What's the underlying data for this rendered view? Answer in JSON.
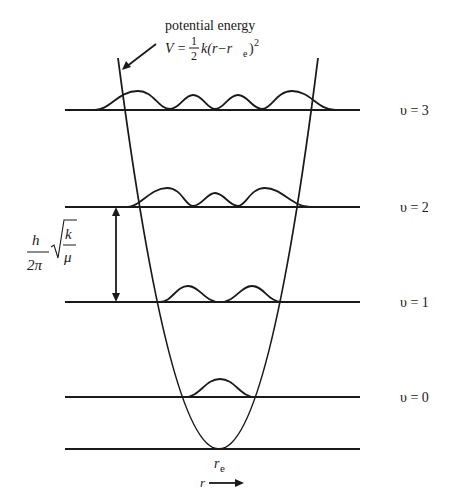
{
  "title_annotation": {
    "line1": "potential energy",
    "formula_lhs": "V = ",
    "frac_num": "1",
    "frac_den": "2",
    "formula_rhs": "k(r−r",
    "formula_sub": "e",
    "formula_close": ")",
    "formula_exp": "2"
  },
  "levels": [
    {
      "label": "υ = 3",
      "y": 110
    },
    {
      "label": "υ = 2",
      "y": 207
    },
    {
      "label": "υ = 1",
      "y": 302
    },
    {
      "label": "υ = 0",
      "y": 397
    }
  ],
  "spacing_label": {
    "num": "h",
    "den": "2π",
    "sqrt_num": "k",
    "sqrt_den": "μ"
  },
  "equilibrium_label": {
    "main": "r",
    "sub": "e"
  },
  "axis_label": "r",
  "colors": {
    "ink": "#1a1a1a",
    "background": "#ffffff"
  }
}
